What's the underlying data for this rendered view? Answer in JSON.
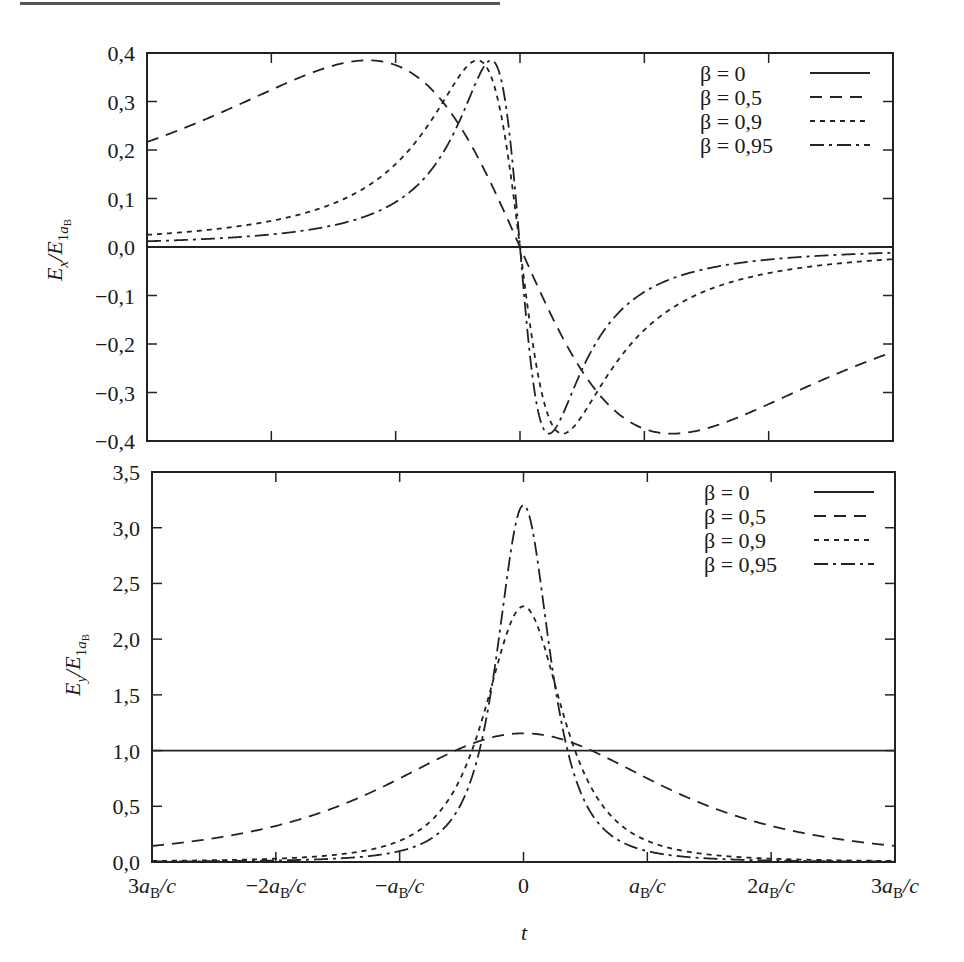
{
  "header_rule": true,
  "chart_data": [
    {
      "type": "line",
      "title": "",
      "xlabel": "t",
      "ylabel": "E_x / E_1 a_B",
      "ylim": [
        -0.4,
        0.4
      ],
      "xlim": [
        -3,
        3
      ],
      "x_unit": "a_B/c",
      "y_ticks": [
        "0,4",
        "0,3",
        "0,2",
        "0,1",
        "0,0",
        "−0,1",
        "−0,2",
        "−0,3",
        "−0,4"
      ],
      "y_tick_values": [
        0.4,
        0.3,
        0.2,
        0.1,
        0.0,
        -0.1,
        -0.2,
        -0.3,
        -0.4
      ],
      "x_tick_values": [
        -3,
        -2,
        -1,
        0,
        1,
        2,
        3
      ],
      "grid": false,
      "legend_position": "upper right",
      "formula": "E_x = -gamma*beta*u / (1 + (gamma*beta*u)^2)^(3/2), u = t c / a_B",
      "series": [
        {
          "name": "β = 0",
          "beta": 0,
          "style": "solid",
          "x": [
            -3,
            -2,
            -1,
            0,
            1,
            2,
            3
          ],
          "values": [
            0,
            0,
            0,
            0,
            0,
            0,
            0
          ]
        },
        {
          "name": "β = 0,5",
          "beta": 0.5,
          "style": "dashed",
          "x": [
            -3,
            -2,
            -1.5,
            -1.22,
            -1,
            -0.5,
            0,
            0.5,
            1,
            1.22,
            1.5,
            2,
            3
          ],
          "values": [
            0.21,
            0.33,
            0.375,
            0.385,
            0.38,
            0.25,
            0,
            -0.25,
            -0.38,
            -0.385,
            -0.375,
            -0.33,
            -0.21
          ]
        },
        {
          "name": "β = 0,9",
          "beta": 0.9,
          "style": "dotted",
          "x": [
            -3,
            -2,
            -1,
            -0.5,
            -0.34,
            -0.2,
            0,
            0.2,
            0.34,
            0.5,
            1,
            2,
            3
          ],
          "values": [
            0.024,
            0.05,
            0.17,
            0.35,
            0.385,
            0.33,
            0,
            -0.33,
            -0.385,
            -0.35,
            -0.17,
            -0.05,
            -0.024
          ]
        },
        {
          "name": "β = 0,95",
          "beta": 0.95,
          "style": "dash-dot",
          "x": [
            -3,
            -2,
            -1,
            -0.5,
            -0.23,
            -0.1,
            0,
            0.1,
            0.23,
            0.5,
            1,
            2,
            3
          ],
          "values": [
            0.011,
            0.023,
            0.09,
            0.26,
            0.385,
            0.27,
            0,
            -0.27,
            -0.385,
            -0.26,
            -0.09,
            -0.023,
            -0.011
          ]
        }
      ]
    },
    {
      "type": "line",
      "title": "",
      "xlabel": "t",
      "ylabel": "E_y / E_1 a_B",
      "ylim": [
        0.0,
        3.5
      ],
      "xlim": [
        -3,
        3
      ],
      "x_unit": "a_B/c",
      "y_ticks": [
        "3,5",
        "3,0",
        "2,5",
        "2,0",
        "1,5",
        "1,0",
        "0,5",
        "0,0"
      ],
      "y_tick_values": [
        3.5,
        3.0,
        2.5,
        2.0,
        1.5,
        1.0,
        0.5,
        0.0
      ],
      "x_tick_values": [
        -3,
        -2,
        -1,
        0,
        1,
        2,
        3
      ],
      "x_tick_labels": [
        "3a_B/c",
        "−2a_B/c",
        "−a_B/c",
        "0",
        "a_B/c",
        "2a_B/c",
        "3a_B/c"
      ],
      "grid": false,
      "legend_position": "upper right",
      "formula": "E_y = gamma / (1 + (gamma*beta*u)^2)^(3/2), u = t c / a_B",
      "series": [
        {
          "name": "β = 0",
          "beta": 0,
          "style": "solid",
          "x": [
            -3,
            -2,
            -1,
            0,
            1,
            2,
            3
          ],
          "values": [
            1,
            1,
            1,
            1,
            1,
            1,
            1
          ]
        },
        {
          "name": "β = 0,5",
          "beta": 0.5,
          "style": "dashed",
          "x": [
            -3,
            -2,
            -1,
            -0.5,
            0,
            0.5,
            1,
            2,
            3
          ],
          "values": [
            0.15,
            0.35,
            0.85,
            1.07,
            1.155,
            1.07,
            0.85,
            0.35,
            0.15
          ]
        },
        {
          "name": "β = 0,9",
          "beta": 0.9,
          "style": "dotted",
          "x": [
            -3,
            -2,
            -1,
            -0.5,
            -0.25,
            0,
            0.25,
            0.5,
            1,
            2,
            3
          ],
          "values": [
            0.011,
            0.036,
            0.23,
            1.0,
            1.78,
            2.294,
            1.78,
            1.0,
            0.23,
            0.036,
            0.011
          ]
        },
        {
          "name": "β = 0,95",
          "beta": 0.95,
          "style": "dash-dot",
          "x": [
            -3,
            -2,
            -1,
            -0.5,
            -0.25,
            0,
            0.25,
            0.5,
            1,
            2,
            3
          ],
          "values": [
            0.004,
            0.013,
            0.1,
            0.58,
            1.65,
            3.203,
            1.65,
            0.58,
            0.1,
            0.013,
            0.004
          ]
        }
      ]
    }
  ],
  "top_plot": {
    "ylabel_main": "E",
    "ylabel_sub": "x",
    "ylabel_div": "/E",
    "ylabel_sub2": "1",
    "ylabel_sub3": "a",
    "ylabel_sub4": "B"
  },
  "bottom_plot": {
    "ylabel_main": "E",
    "ylabel_sub": "y",
    "ylabel_div": "/E",
    "ylabel_sub2": "1",
    "ylabel_sub3": "a",
    "ylabel_sub4": "B"
  },
  "legend": {
    "items": [
      {
        "label": "β = 0",
        "style": "solid"
      },
      {
        "label": "β = 0,5",
        "style": "dashed"
      },
      {
        "label": "β = 0,9",
        "style": "dotted"
      },
      {
        "label": "β = 0,95",
        "style": "dash-dot"
      }
    ]
  },
  "x_axis": {
    "title": "t",
    "tick_labels": [
      {
        "num": "3",
        "a": "a",
        "sub": "B",
        "rest": "/c"
      },
      {
        "num": "−2",
        "a": "a",
        "sub": "B",
        "rest": "/c"
      },
      {
        "num": "−",
        "a": "a",
        "sub": "B",
        "rest": "/c"
      },
      {
        "num": "0",
        "a": "",
        "sub": "",
        "rest": ""
      },
      {
        "num": "",
        "a": "a",
        "sub": "B",
        "rest": "/c"
      },
      {
        "num": "2",
        "a": "a",
        "sub": "B",
        "rest": "/c"
      },
      {
        "num": "3",
        "a": "a",
        "sub": "B",
        "rest": "/c"
      }
    ]
  }
}
